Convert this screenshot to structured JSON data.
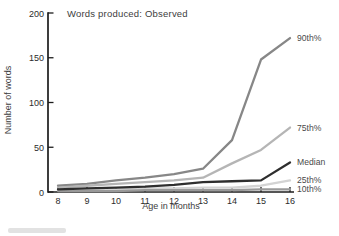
{
  "figure": {
    "title": "Words produced: Observed",
    "xlabel": "Age in months",
    "ylabel": "Number of words"
  },
  "chart_data": {
    "type": "line",
    "title": "Words produced: Observed",
    "xlabel": "Age in months",
    "ylabel": "Number of words",
    "x": [
      8,
      9,
      10,
      11,
      12,
      13,
      14,
      15,
      16
    ],
    "x_ticks": [
      "8",
      "9",
      "10",
      "11",
      "12",
      "13",
      "14",
      "15",
      "16"
    ],
    "y_ticks": [
      "0",
      "50",
      "100",
      "150",
      "200"
    ],
    "y_tick_values": [
      0,
      50,
      100,
      150,
      200
    ],
    "xlim": [
      8,
      16
    ],
    "ylim": [
      0,
      200
    ],
    "grid": false,
    "legend_position": "end-of-line-labels-right",
    "series": [
      {
        "name": "90th-percentile",
        "label": "90th%",
        "color": "#878787",
        "values": [
          7,
          9,
          13,
          16,
          20,
          26,
          58,
          148,
          172
        ]
      },
      {
        "name": "75th-percentile",
        "label": "75th%",
        "color": "#b5b5b5",
        "values": [
          5,
          7,
          9,
          11,
          13,
          16,
          32,
          47,
          72
        ]
      },
      {
        "name": "median",
        "label": "Median",
        "color": "#2e2e2e",
        "values": [
          3,
          4,
          5,
          6,
          8,
          11,
          12,
          13,
          33
        ]
      },
      {
        "name": "25th-percentile",
        "label": "25th%",
        "color": "#d3d3d3",
        "values": [
          2,
          3,
          3,
          4,
          4,
          5,
          5,
          7,
          13
        ]
      },
      {
        "name": "10th-percentile",
        "label": "10th%",
        "color": "#999999",
        "values": [
          1,
          1,
          1,
          2,
          2,
          2,
          2,
          3,
          3
        ]
      }
    ],
    "label_color": "#4a4a4a",
    "axis_color": "#1c1c1c"
  }
}
